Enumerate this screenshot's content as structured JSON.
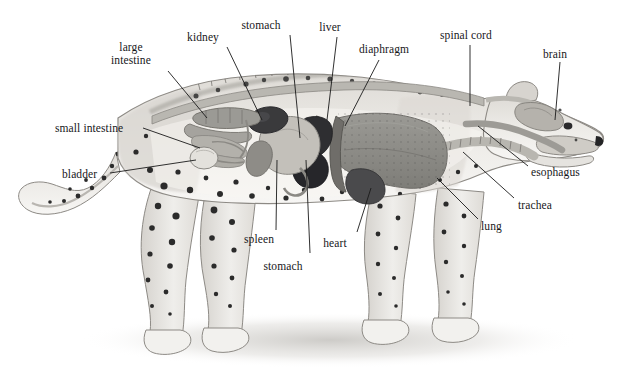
{
  "figure": {
    "style": "grayscale pencil illustration, cutaway side view facing right",
    "background_color": "#ffffff",
    "ink_color": "#17171a",
    "leader_line_color": "#1a1a1a"
  },
  "palette": {
    "body_fill": "#e9e7e3",
    "body_shade": "#cfccc6",
    "body_outline": "#8d8a85",
    "spot_color": "#2b2b2b",
    "cavity_fill": "#f6f5f2",
    "large_intestine": "#9b9a95",
    "small_intestine": "#b3b1ab",
    "kidney": "#3a3a3c",
    "spleen": "#8e8c87",
    "stomach": "#c3c0ba",
    "liver": "#2e2e31",
    "heart": "#4a4a4c",
    "lung": "#8a8984",
    "diaphragm": "#6f6d69",
    "trachea": "#b8b6b0",
    "esophagus": "#9d9b96",
    "spinal_cord": "#b9b7b1",
    "brain": "#b5b2ac",
    "bladder": "#e3e1dc",
    "shadow": "#cdcbc7"
  },
  "labels": [
    {
      "id": "large-intestine",
      "text": "large\nintestine",
      "line1": "large",
      "line2": "intestine",
      "x": 131,
      "y": 41,
      "anchor": "center",
      "leader": {
        "x1": 168,
        "y1": 71,
        "x2": 207,
        "y2": 118
      }
    },
    {
      "id": "kidney",
      "text": "kidney",
      "x": 203,
      "y": 31,
      "anchor": "center",
      "leader": {
        "x1": 227,
        "y1": 47,
        "x2": 262,
        "y2": 120
      }
    },
    {
      "id": "stomach-top",
      "text": "stomach",
      "x": 261,
      "y": 19,
      "anchor": "center",
      "leader": {
        "x1": 290,
        "y1": 35,
        "x2": 300,
        "y2": 138
      }
    },
    {
      "id": "liver",
      "text": "liver",
      "x": 330,
      "y": 21,
      "anchor": "center",
      "leader": {
        "x1": 337,
        "y1": 37,
        "x2": 327,
        "y2": 120
      }
    },
    {
      "id": "diaphragm",
      "text": "diaphragm",
      "x": 359,
      "y": 43,
      "anchor": "left",
      "leader": {
        "x1": 379,
        "y1": 60,
        "x2": 345,
        "y2": 126
      }
    },
    {
      "id": "spinal-cord",
      "text": "spinal cord",
      "x": 440,
      "y": 29,
      "anchor": "left",
      "leader": {
        "x1": 470,
        "y1": 45,
        "x2": 470,
        "y2": 106
      }
    },
    {
      "id": "brain",
      "text": "brain",
      "x": 543,
      "y": 48,
      "anchor": "left",
      "leader": {
        "x1": 560,
        "y1": 62,
        "x2": 555,
        "y2": 120
      }
    },
    {
      "id": "esophagus",
      "text": "esophagus",
      "x": 531,
      "y": 166,
      "anchor": "left",
      "leader": {
        "x1": 528,
        "y1": 166,
        "x2": 478,
        "y2": 126
      }
    },
    {
      "id": "trachea",
      "text": "trachea",
      "x": 518,
      "y": 199,
      "anchor": "left",
      "leader": {
        "x1": 514,
        "y1": 198,
        "x2": 463,
        "y2": 152
      }
    },
    {
      "id": "lung",
      "text": "lung",
      "x": 481,
      "y": 220,
      "anchor": "left",
      "leader": {
        "x1": 478,
        "y1": 219,
        "x2": 437,
        "y2": 178
      }
    },
    {
      "id": "small-intestine",
      "text": "small intestine",
      "x": 55,
      "y": 122,
      "anchor": "left",
      "leader": {
        "x1": 143,
        "y1": 128,
        "x2": 200,
        "y2": 148
      }
    },
    {
      "id": "bladder",
      "text": "bladder",
      "x": 62,
      "y": 168,
      "anchor": "left",
      "leader": {
        "x1": 110,
        "y1": 173,
        "x2": 196,
        "y2": 160
      }
    },
    {
      "id": "spleen",
      "text": "spleen",
      "x": 259,
      "y": 233,
      "anchor": "center",
      "leader": {
        "x1": 276,
        "y1": 230,
        "x2": 277,
        "y2": 160
      }
    },
    {
      "id": "stomach-bottom",
      "text": "stomach",
      "x": 283,
      "y": 260,
      "anchor": "center",
      "leader": {
        "x1": 310,
        "y1": 253,
        "x2": 306,
        "y2": 160
      }
    },
    {
      "id": "heart",
      "text": "heart",
      "x": 335,
      "y": 237,
      "anchor": "center",
      "leader": {
        "x1": 357,
        "y1": 232,
        "x2": 371,
        "y2": 188
      }
    }
  ],
  "organs": [
    {
      "id": "brain",
      "name": "brain"
    },
    {
      "id": "spinal-cord",
      "name": "spinal cord"
    },
    {
      "id": "esophagus",
      "name": "esophagus"
    },
    {
      "id": "trachea",
      "name": "trachea"
    },
    {
      "id": "lung",
      "name": "lung"
    },
    {
      "id": "heart",
      "name": "heart"
    },
    {
      "id": "diaphragm",
      "name": "diaphragm"
    },
    {
      "id": "liver",
      "name": "liver"
    },
    {
      "id": "stomach",
      "name": "stomach"
    },
    {
      "id": "spleen",
      "name": "spleen"
    },
    {
      "id": "kidney",
      "name": "kidney"
    },
    {
      "id": "large-intestine",
      "name": "large intestine"
    },
    {
      "id": "small-intestine",
      "name": "small intestine"
    },
    {
      "id": "bladder",
      "name": "bladder"
    }
  ]
}
